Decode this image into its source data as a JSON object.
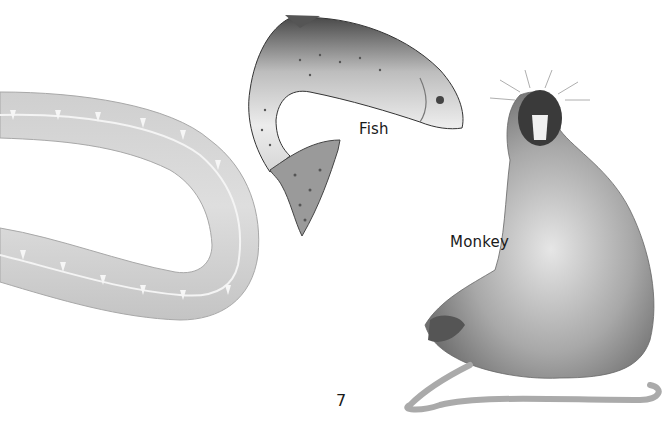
{
  "page": {
    "background": "#ffffff",
    "page_number": "7"
  },
  "illustrations": [
    {
      "id": "eel",
      "label": "",
      "color": "#c8c8c8"
    },
    {
      "id": "fish",
      "label": "Fish",
      "color": "#8a8a8a"
    },
    {
      "id": "monkey",
      "label": "Monkey",
      "color": "#7a7a7a"
    }
  ],
  "labels": {
    "fish": "Fish",
    "monkey": "Monkey"
  }
}
